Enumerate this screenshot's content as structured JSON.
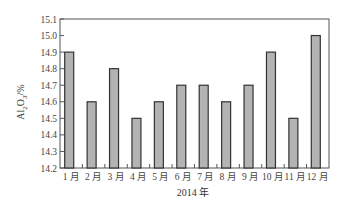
{
  "chart_data": {
    "type": "bar",
    "title": "",
    "xlabel": "2014 年",
    "ylabel": "Al2O3/%",
    "ylabel_display": {
      "base": "Al",
      "sub1": "2",
      "mid": "O",
      "sub2": "3",
      "tail": "/%"
    },
    "categories": [
      "1 月",
      "2 月",
      "3 月",
      "4 月",
      "5 月",
      "6 月",
      "7 月",
      "8 月",
      "9 月",
      "10 月",
      "11 月",
      "12 月"
    ],
    "values": [
      14.9,
      14.6,
      14.8,
      14.5,
      14.6,
      14.7,
      14.7,
      14.6,
      14.7,
      14.9,
      14.5,
      15.0
    ],
    "ylim": [
      14.2,
      15.1
    ],
    "yticks": [
      14.2,
      14.3,
      14.4,
      14.5,
      14.6,
      14.7,
      14.8,
      14.9,
      15.0,
      15.1
    ],
    "ytick_labels": [
      "14.2",
      "14.3",
      "14.4",
      "14.5",
      "14.6",
      "14.7",
      "14.8",
      "14.9",
      "15.0",
      "15.1"
    ],
    "grid": false,
    "legend": null,
    "colors": {
      "bar_fill": "#b3b3b3",
      "bar_stroke": "#333333",
      "axis": "#555555"
    }
  }
}
